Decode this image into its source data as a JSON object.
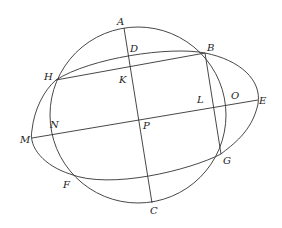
{
  "diagram": {
    "labels": {
      "A": "A",
      "B": "B",
      "C": "C",
      "D": "D",
      "E": "E",
      "F": "F",
      "G": "G",
      "H": "H",
      "K": "K",
      "L": "L",
      "M": "M",
      "N": "N",
      "O": "O",
      "P": "P"
    },
    "stroke_color": "#333333",
    "background": "#ffffff"
  }
}
